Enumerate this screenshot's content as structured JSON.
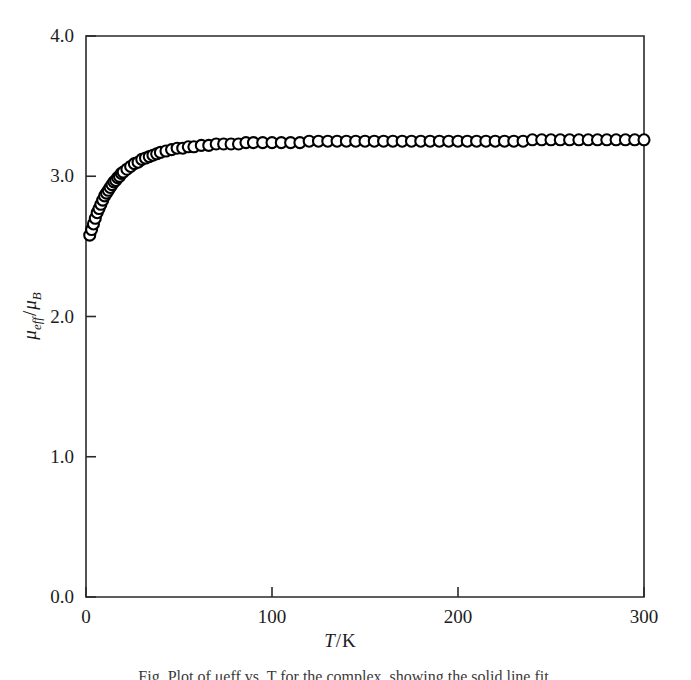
{
  "figure": {
    "background_color": "#ffffff",
    "foreground_color": "#1a1a1a",
    "caption_partial": "Fig. Plot of μeff vs. T for the complex, showing the solid line fit."
  },
  "axes": {
    "x": {
      "label_main": "T",
      "label_sep": "/",
      "label_unit": "K",
      "label_full": "T/K",
      "ticks": [
        0,
        100,
        200,
        300
      ],
      "tick_labels": [
        "0",
        "100",
        "200",
        "300"
      ],
      "min": 0,
      "max": 300
    },
    "y": {
      "label_main": "μ",
      "label_sub1": "eff",
      "label_sep": "/",
      "label_main2": "μ",
      "label_sub2": "B",
      "label_full": "μeff/μB",
      "ticks": [
        0.0,
        1.0,
        2.0,
        3.0,
        4.0
      ],
      "tick_labels": [
        "0.0",
        "1.0",
        "2.0",
        "3.0",
        "4.0"
      ],
      "min": 0.0,
      "max": 4.0
    }
  },
  "chart_data": {
    "type": "scatter",
    "title": "",
    "subtitle": "",
    "xlabel": "T/K",
    "ylabel": "μeff/μB",
    "xlim": [
      0,
      300
    ],
    "ylim": [
      0,
      4
    ],
    "grid": false,
    "legend": null,
    "marker_style": "open-circle",
    "marker_size_px": 11,
    "series": [
      {
        "name": "experimental",
        "type": "scatter",
        "marker": "open-circle",
        "x": [
          2,
          3,
          4,
          5,
          6,
          7,
          8,
          9,
          10,
          11,
          12,
          13,
          14,
          15,
          16,
          17,
          18,
          19,
          20,
          22,
          24,
          26,
          28,
          30,
          32,
          34,
          36,
          38,
          40,
          43,
          46,
          49,
          52,
          55,
          58,
          62,
          66,
          70,
          74,
          78,
          82,
          86,
          90,
          95,
          100,
          105,
          110,
          115,
          120,
          125,
          130,
          135,
          140,
          145,
          150,
          155,
          160,
          165,
          170,
          175,
          180,
          185,
          190,
          195,
          200,
          205,
          210,
          215,
          220,
          225,
          230,
          235,
          240,
          245,
          250,
          255,
          260,
          265,
          270,
          275,
          280,
          285,
          290,
          295,
          300
        ],
        "y": [
          2.58,
          2.62,
          2.66,
          2.7,
          2.74,
          2.77,
          2.8,
          2.83,
          2.86,
          2.88,
          2.9,
          2.92,
          2.94,
          2.96,
          2.97,
          2.99,
          3.0,
          3.02,
          3.03,
          3.05,
          3.07,
          3.09,
          3.1,
          3.12,
          3.13,
          3.14,
          3.15,
          3.16,
          3.17,
          3.18,
          3.19,
          3.2,
          3.2,
          3.21,
          3.21,
          3.22,
          3.22,
          3.23,
          3.23,
          3.23,
          3.23,
          3.24,
          3.24,
          3.24,
          3.24,
          3.24,
          3.24,
          3.24,
          3.25,
          3.25,
          3.25,
          3.25,
          3.25,
          3.25,
          3.25,
          3.25,
          3.25,
          3.25,
          3.25,
          3.25,
          3.25,
          3.25,
          3.25,
          3.25,
          3.25,
          3.25,
          3.25,
          3.25,
          3.25,
          3.25,
          3.25,
          3.25,
          3.26,
          3.26,
          3.26,
          3.26,
          3.26,
          3.26,
          3.26,
          3.26,
          3.26,
          3.26,
          3.26,
          3.26,
          3.26
        ]
      },
      {
        "name": "theoretical fit",
        "type": "line",
        "x": [
          2,
          4,
          6,
          8,
          10,
          12,
          14,
          16,
          18,
          20,
          24,
          28,
          32,
          36,
          40,
          45,
          50,
          55,
          60,
          65,
          70,
          80,
          90,
          100,
          120,
          140,
          160,
          180,
          200,
          220,
          240,
          260,
          280,
          300
        ],
        "y": [
          2.62,
          2.71,
          2.79,
          2.85,
          2.91,
          2.95,
          2.99,
          3.02,
          3.05,
          3.07,
          3.11,
          3.14,
          3.16,
          3.18,
          3.19,
          3.21,
          3.22,
          3.23,
          3.23,
          3.24,
          3.24,
          3.25,
          3.25,
          3.26,
          3.26,
          3.26,
          3.26,
          3.26,
          3.26,
          3.26,
          3.27,
          3.27,
          3.27,
          3.27
        ]
      }
    ]
  }
}
